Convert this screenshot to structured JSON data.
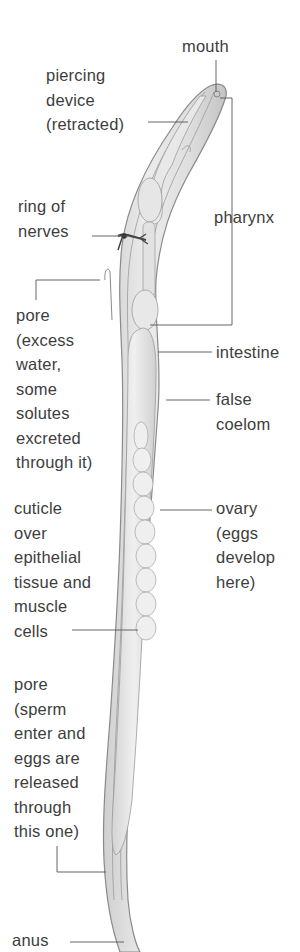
{
  "diagram": {
    "labels": [
      {
        "id": "mouth",
        "text": "mouth",
        "x": 182,
        "y": 34
      },
      {
        "id": "piercing-device",
        "text": "piercing\ndevice\n(retracted)",
        "x": 46,
        "y": 63
      },
      {
        "id": "ring-of-nerves",
        "text": "ring of\nnerves",
        "x": 18,
        "y": 194
      },
      {
        "id": "pharynx",
        "text": "pharynx",
        "x": 214,
        "y": 205
      },
      {
        "id": "pore-excretory",
        "text": "pore\n(excess\nwater,\nsome\nsolutes\nexcreted\nthrough it)",
        "x": 16,
        "y": 303
      },
      {
        "id": "intestine",
        "text": "intestine",
        "x": 216,
        "y": 340
      },
      {
        "id": "false-coelom",
        "text": "false\ncoelom",
        "x": 216,
        "y": 387
      },
      {
        "id": "cuticle",
        "text": "cuticle\nover\nepithelial\ntissue and\nmuscle\ncells",
        "x": 14,
        "y": 496
      },
      {
        "id": "ovary",
        "text": "ovary\n(eggs\ndevelop\nhere)",
        "x": 216,
        "y": 496
      },
      {
        "id": "pore-reproductive",
        "text": "pore\n(sperm\nenter and\neggs are\nreleased\nthrough\nthis one)",
        "x": 14,
        "y": 672
      },
      {
        "id": "anus",
        "text": "anus",
        "x": 12,
        "y": 928
      }
    ],
    "colors": {
      "body_fill": "#e4e4e4",
      "body_outline": "#8a8a8a",
      "leader_line": "#555555",
      "text": "#3d3d3d"
    }
  }
}
